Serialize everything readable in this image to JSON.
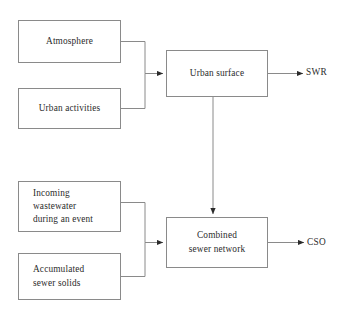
{
  "diagram": {
    "type": "flow-diagram",
    "background_color": "#ffffff",
    "line_color": "#8a8a8a",
    "text_color": "#2b2b2b",
    "nodes": [
      {
        "id": "atmosphere",
        "label": "Atmosphere",
        "align": "center"
      },
      {
        "id": "urban_activities",
        "label": "Urban activities",
        "align": "center"
      },
      {
        "id": "urban_surface",
        "label": "Urban surface",
        "align": "center"
      },
      {
        "id": "incoming",
        "label": "Incoming\nwastewater\nduring an event",
        "align": "left"
      },
      {
        "id": "accumulated",
        "label": "Accumulated\nsewer solids",
        "align": "left"
      },
      {
        "id": "combined",
        "label": "Combined\nsewer network",
        "align": "center"
      }
    ],
    "outputs": [
      {
        "id": "swr",
        "label": "SWR",
        "from": "urban_surface"
      },
      {
        "id": "cso",
        "label": "CSO",
        "from": "combined"
      }
    ],
    "edges": [
      {
        "from": "atmosphere",
        "to": "urban_surface",
        "style": "elbow"
      },
      {
        "from": "urban_activities",
        "to": "urban_surface",
        "style": "elbow"
      },
      {
        "from": "urban_surface",
        "to": "combined",
        "style": "vertical"
      },
      {
        "from": "incoming",
        "to": "combined",
        "style": "elbow"
      },
      {
        "from": "accumulated",
        "to": "combined",
        "style": "elbow"
      },
      {
        "from": "urban_surface",
        "to": "swr",
        "style": "straight"
      },
      {
        "from": "combined",
        "to": "cso",
        "style": "straight"
      }
    ]
  }
}
